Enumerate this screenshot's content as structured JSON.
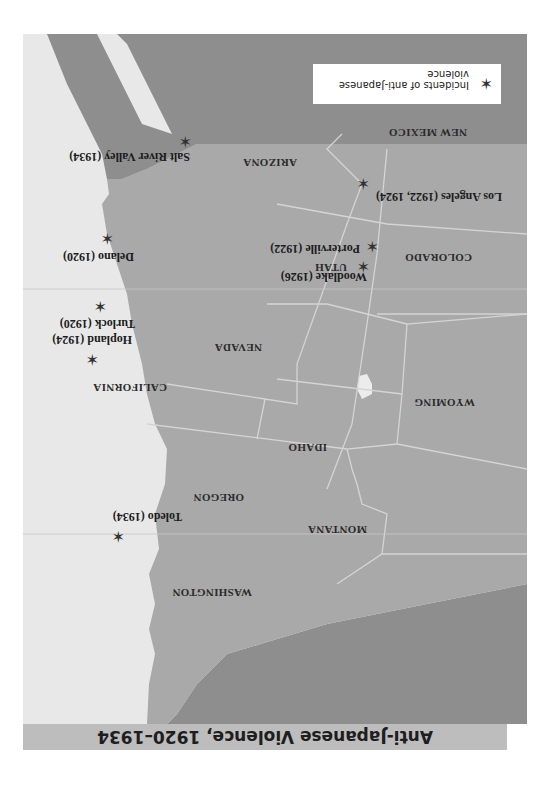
{
  "title": "Anti-Japanese Violence, 1920–1934",
  "legend": {
    "icon": "star-icon",
    "label": "Incidents of anti-Japanese violence"
  },
  "colors": {
    "land": "#a9a9a9",
    "foreign_land": "#8e8e8e",
    "water": "#e8e8e8",
    "border": "#d8d8d8",
    "title_bar": "#bdbdbd",
    "marker": "#333333"
  },
  "states": [
    {
      "name": "WASHINGTON"
    },
    {
      "name": "OREGON"
    },
    {
      "name": "CALIFORNIA"
    },
    {
      "name": "IDAHO"
    },
    {
      "name": "NEVADA"
    },
    {
      "name": "MONTANA"
    },
    {
      "name": "WYOMING"
    },
    {
      "name": "UTAH"
    },
    {
      "name": "ARIZONA"
    },
    {
      "name": "COLORADO"
    },
    {
      "name": "NEW MEXICO"
    }
  ],
  "incidents": [
    {
      "place": "Toledo",
      "years": "(1934)"
    },
    {
      "place": "Hopland",
      "years": "(1924)"
    },
    {
      "place": "Turlock",
      "years": "(1920)"
    },
    {
      "place": "Delano",
      "years": "(1920)"
    },
    {
      "place": "Woodlake",
      "years": "(1926)"
    },
    {
      "place": "Porterville",
      "years": "(1922)"
    },
    {
      "place": "Los Angeles",
      "years": "(1922, 1924)"
    },
    {
      "place": "Salt River Valley",
      "years": "(1934)"
    }
  ]
}
